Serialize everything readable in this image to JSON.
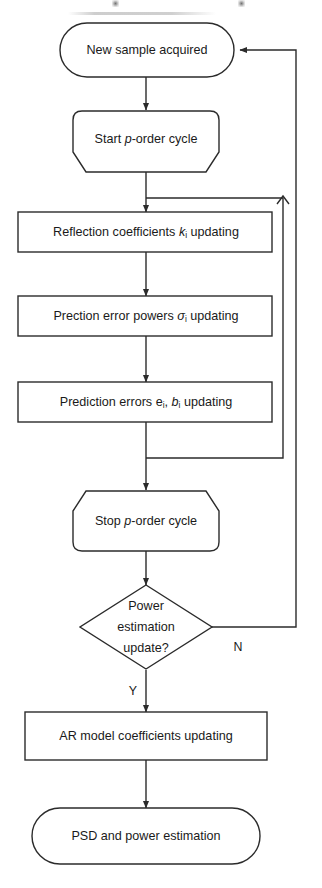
{
  "figure": {
    "type": "flowchart",
    "width": 322,
    "height": 888,
    "background_color": "#ffffff",
    "line_color": "#2b2b2b",
    "text_color": "#1a1a1a"
  },
  "nodes": {
    "new_sample": {
      "id": "new-sample-acquired",
      "shape": "stadium",
      "label": "New sample acquired"
    },
    "start_cycle": {
      "id": "start-p-order-cycle",
      "shape": "loop-start",
      "label_pre": "Start ",
      "label_italic": "p",
      "label_post": "-order cycle",
      "label": "Start p-order cycle"
    },
    "reflection": {
      "id": "reflection-coefficients-updating",
      "shape": "rectangle",
      "label_pre": "Reflection coefficients ",
      "label_italic": "k",
      "label_sub": "i",
      "label_post": " updating",
      "label": "Reflection coefficients kᵢ updating"
    },
    "error_powers": {
      "id": "prediction-error-powers-updating",
      "shape": "rectangle",
      "label_pre": "Prection error powers ",
      "label_italic": "σ",
      "label_sub": "i",
      "label_post": " updating",
      "label": "Prection error powers σᵢ updating"
    },
    "prediction_errors": {
      "id": "prediction-errors-updating",
      "shape": "rectangle",
      "label_pre": "Prediction errors e",
      "label_sub1": "i",
      "label_mid": ", ",
      "label_italic": "b",
      "label_sub2": "i",
      "label_post": " updating",
      "label": "Prediction errors eᵢ, bᵢ updating"
    },
    "stop_cycle": {
      "id": "stop-p-order-cycle",
      "shape": "loop-end",
      "label_pre": "Stop ",
      "label_italic": "p",
      "label_post": "-order cycle",
      "label": "Stop p-order cycle"
    },
    "decision": {
      "id": "power-estimation-update-decision",
      "shape": "diamond",
      "line1": "Power",
      "line2": "estimation",
      "line3": "update?",
      "label": "Power estimation update?"
    },
    "ar_model": {
      "id": "ar-model-coefficients-updating",
      "shape": "rectangle",
      "label": "AR model coefficients updating"
    },
    "psd": {
      "id": "psd-and-power-estimation",
      "shape": "stadium",
      "label": "PSD and power estimation"
    }
  },
  "edges": {
    "yes_label": "Y",
    "no_label": "N",
    "inner_loop_name": "p-order cycle feedback",
    "outer_loop_name": "no-branch return to new sample"
  }
}
